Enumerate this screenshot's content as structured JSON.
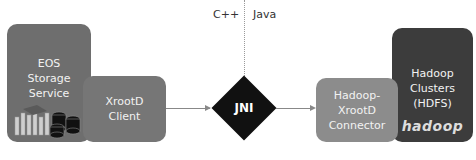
{
  "labels": {
    "left_language": "C++",
    "right_language": "Java"
  },
  "nodes": {
    "eos": [
      "EOS",
      "Storage",
      "Service"
    ],
    "xrootd_client": [
      "XrootD",
      "Client"
    ],
    "jni": "JNI",
    "connector": [
      "Hadoop-",
      "XrootD",
      "Connector"
    ],
    "hadoop_clusters": [
      "Hadoop",
      "Clusters",
      "(HDFS)"
    ],
    "hadoop_logo": "hadoop"
  },
  "colors": {
    "eos": "#6e6e6e",
    "xrootd_client": "#767676",
    "jni": "#111111",
    "connector": "#8c8c8c",
    "hadoop_clusters": "#3c3c3c"
  }
}
